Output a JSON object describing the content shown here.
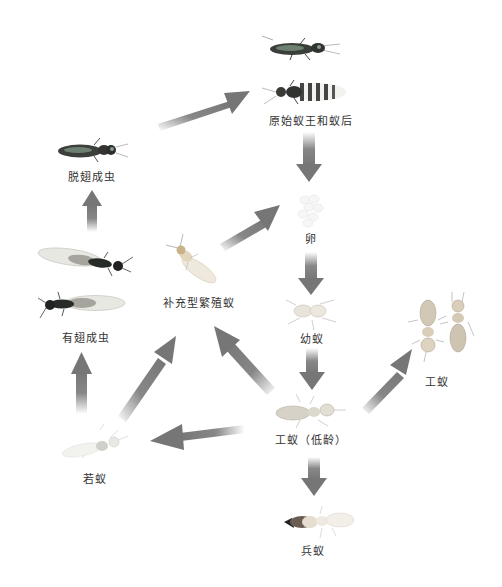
{
  "diagram": {
    "type": "termite-life-cycle",
    "arrow_color": "#7a7a7a",
    "nodes": [
      {
        "id": "king-queen",
        "label": "原始蚁王和蚁后",
        "x": 311,
        "y": 120
      },
      {
        "id": "dealate",
        "label": "脱翅成虫",
        "x": 92,
        "y": 176
      },
      {
        "id": "egg",
        "label": "卵",
        "x": 311,
        "y": 238
      },
      {
        "id": "alate",
        "label": "有翅成虫",
        "x": 86,
        "y": 337
      },
      {
        "id": "neotenic",
        "label": "补充型繁殖蚁",
        "x": 199,
        "y": 302
      },
      {
        "id": "larva",
        "label": "幼蚁",
        "x": 312,
        "y": 338
      },
      {
        "id": "worker",
        "label": "工蚁",
        "x": 437,
        "y": 381
      },
      {
        "id": "young-worker",
        "label": "工蚁（低龄）",
        "x": 311,
        "y": 439
      },
      {
        "id": "nymph",
        "label": "若蚁",
        "x": 95,
        "y": 478
      },
      {
        "id": "soldier",
        "label": "兵蚁",
        "x": 313,
        "y": 550
      }
    ],
    "edges": [
      {
        "from": "dealate",
        "to": "king-queen"
      },
      {
        "from": "king-queen",
        "to": "egg"
      },
      {
        "from": "alate",
        "to": "dealate"
      },
      {
        "from": "neotenic",
        "to": "egg"
      },
      {
        "from": "egg",
        "to": "larva"
      },
      {
        "from": "nymph",
        "to": "alate"
      },
      {
        "from": "nymph",
        "to": "neotenic"
      },
      {
        "from": "young-worker",
        "to": "neotenic"
      },
      {
        "from": "larva",
        "to": "young-worker"
      },
      {
        "from": "young-worker",
        "to": "worker"
      },
      {
        "from": "young-worker",
        "to": "nymph"
      },
      {
        "from": "young-worker",
        "to": "soldier"
      }
    ]
  }
}
